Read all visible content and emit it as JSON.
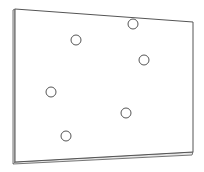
{
  "diagram": {
    "stroke_color": "#555555",
    "edge_color": "#777777",
    "fill_color": "#ffffff",
    "plate": {
      "front_face": [
        [
          15,
          9
        ],
        [
          193,
          22
        ],
        [
          193,
          152
        ],
        [
          15,
          162
        ]
      ],
      "left_edge": [
        [
          13,
          10
        ],
        [
          15,
          9
        ],
        [
          15,
          162
        ],
        [
          13,
          164
        ]
      ],
      "bottom_edge": [
        [
          15,
          162
        ],
        [
          193,
          152
        ],
        [
          192,
          155
        ],
        [
          13,
          164
        ]
      ]
    },
    "hole_radius": 5,
    "holes": [
      {
        "cx": 133,
        "cy": 24
      },
      {
        "cx": 76,
        "cy": 40
      },
      {
        "cx": 144,
        "cy": 60
      },
      {
        "cx": 51,
        "cy": 92
      },
      {
        "cx": 126,
        "cy": 113
      },
      {
        "cx": 66,
        "cy": 136
      }
    ]
  }
}
